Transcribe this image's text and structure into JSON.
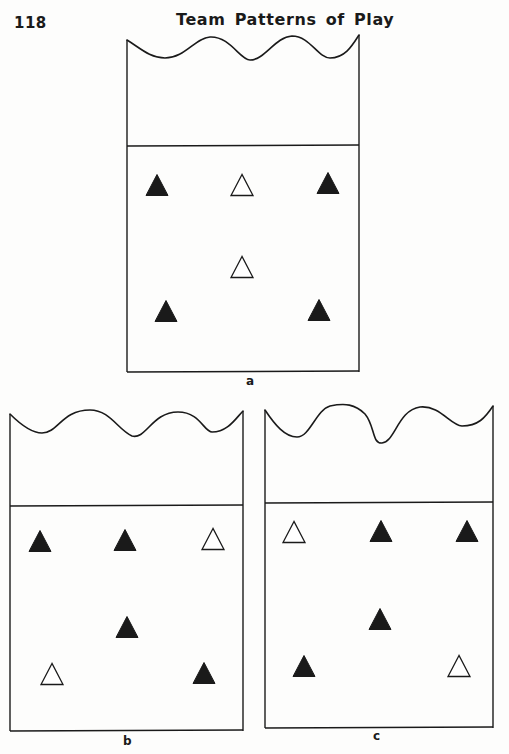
{
  "page": {
    "number": "118",
    "running_title": "Team Patterns of Play"
  },
  "legend": {
    "filled": "filled-triangle (player)",
    "hollow": "hollow-triangle (player)"
  },
  "diagrams": [
    {
      "id": "a",
      "label": "a",
      "court": {
        "left": 127,
        "right": 359,
        "top": 37,
        "net_y": 146,
        "bottom": 372
      },
      "wave_path": "M127,40 C140,48 150,58 165,58 C185,58 195,38 210,37 C230,36 240,60 250,60 C265,60 275,37 292,36 C310,36 318,58 330,58 C345,58 352,46 359,35",
      "label_pos": {
        "x": 246,
        "y": 374
      },
      "players": [
        {
          "type": "filled",
          "x": 157,
          "y": 185
        },
        {
          "type": "hollow",
          "x": 242,
          "y": 185
        },
        {
          "type": "filled",
          "x": 328,
          "y": 183
        },
        {
          "type": "hollow",
          "x": 242,
          "y": 267
        },
        {
          "type": "filled",
          "x": 166,
          "y": 311
        },
        {
          "type": "filled",
          "x": 319,
          "y": 310
        }
      ]
    },
    {
      "id": "b",
      "label": "b",
      "court": {
        "left": 10,
        "right": 243,
        "top": 413,
        "net_y": 506,
        "bottom": 731
      },
      "wave_path": "M10,414 C18,422 30,433 42,433 C58,433 62,410 90,410 C110,410 118,430 132,436 C146,440 152,412 178,412 C200,412 204,432 212,432 C228,432 236,418 243,411",
      "label_pos": {
        "x": 123,
        "y": 734
      },
      "players": [
        {
          "type": "filled",
          "x": 40,
          "y": 541
        },
        {
          "type": "filled",
          "x": 125,
          "y": 540
        },
        {
          "type": "hollow",
          "x": 213,
          "y": 539
        },
        {
          "type": "filled",
          "x": 127,
          "y": 627
        },
        {
          "type": "hollow",
          "x": 52,
          "y": 674
        },
        {
          "type": "filled",
          "x": 204,
          "y": 673
        }
      ]
    },
    {
      "id": "c",
      "label": "c",
      "court": {
        "left": 265,
        "right": 493,
        "top": 410,
        "net_y": 503,
        "bottom": 728
      },
      "wave_path": "M265,410 C275,425 285,437 297,437 C310,437 316,410 330,406 C345,403 355,404 365,414 C375,426 372,444 382,443 C395,442 398,410 420,407 C440,405 450,425 462,426 C478,426 485,418 493,406",
      "label_pos": {
        "x": 373,
        "y": 729
      },
      "players": [
        {
          "type": "hollow",
          "x": 294,
          "y": 532
        },
        {
          "type": "filled",
          "x": 381,
          "y": 531
        },
        {
          "type": "filled",
          "x": 467,
          "y": 531
        },
        {
          "type": "filled",
          "x": 380,
          "y": 619
        },
        {
          "type": "filled",
          "x": 304,
          "y": 666
        },
        {
          "type": "hollow",
          "x": 459,
          "y": 666
        }
      ]
    }
  ],
  "colors": {
    "ink": "#1a1a1a",
    "paper": "#fdfdfc"
  }
}
